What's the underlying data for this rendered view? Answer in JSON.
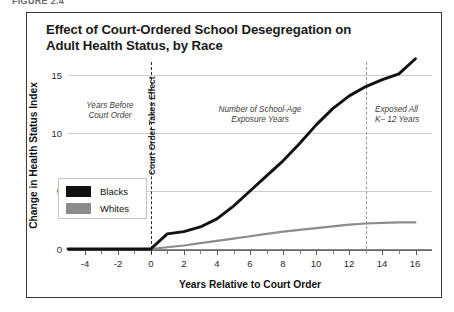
{
  "figure_label": "FIGURE 2.4",
  "title": {
    "line1": "Effect of Court-Ordered School Desegregation on",
    "line2": "Adult Health Status, by Race"
  },
  "axes": {
    "ylabel": "Change in Health Status Index",
    "xlabel": "Years Relative to Court Order",
    "yticks": [
      "0",
      "5",
      "10",
      "15"
    ],
    "xticks": [
      "-4",
      "-2",
      "0",
      "2",
      "4",
      "6",
      "8",
      "10",
      "12",
      "14",
      "16"
    ]
  },
  "legend": {
    "items": [
      {
        "label": "Blacks",
        "color": "#111111"
      },
      {
        "label": "Whites",
        "color": "#8c8c8c"
      }
    ]
  },
  "annotations": {
    "before": {
      "line1": "Years Before",
      "line2": "Court Order"
    },
    "court_order": "Court Order Takes Effect",
    "exposure": {
      "line1": "Number of School-Age",
      "line2": "Exposure Years"
    },
    "exposed_all": {
      "line1": "Exposed All",
      "line2": "K– 12 Years"
    }
  },
  "chart_data": {
    "type": "line",
    "title": "Effect of Court-Ordered School Desegregation on Adult Health Status, by Race",
    "xlabel": "Years Relative to Court Order",
    "ylabel": "Change in Health Status Index",
    "xlim": [
      -5,
      17
    ],
    "ylim": [
      -1.5,
      17.5
    ],
    "yticks": [
      0,
      5,
      10,
      15
    ],
    "xticks": [
      -4,
      -2,
      0,
      2,
      4,
      6,
      8,
      10,
      12,
      14,
      16
    ],
    "grid": "horizontal",
    "legend_position": "inside-left",
    "reference_lines": [
      {
        "x": 0,
        "label": "Court Order Takes Effect",
        "style": "dashed",
        "color": "#2b2b2b"
      },
      {
        "x": 13,
        "label": "Exposed All K-12 Years",
        "style": "dashed",
        "color": "#9a9a9a"
      }
    ],
    "x": [
      -5,
      -4,
      -3,
      -2,
      -1,
      0,
      1,
      2,
      3,
      4,
      5,
      6,
      7,
      8,
      9,
      10,
      11,
      12,
      13,
      14,
      15,
      16
    ],
    "series": [
      {
        "name": "Blacks",
        "color": "#111111",
        "values": [
          0.0,
          0.0,
          0.0,
          0.0,
          0.0,
          0.0,
          1.3,
          1.5,
          1.9,
          2.6,
          3.7,
          5.0,
          6.3,
          7.6,
          9.1,
          10.7,
          12.1,
          13.2,
          14.0,
          14.6,
          15.1,
          16.4
        ]
      },
      {
        "name": "Whites",
        "color": "#8c8c8c",
        "values": [
          0.0,
          0.0,
          0.0,
          0.0,
          0.0,
          0.0,
          0.15,
          0.3,
          0.5,
          0.7,
          0.9,
          1.1,
          1.3,
          1.5,
          1.65,
          1.8,
          1.95,
          2.1,
          2.2,
          2.25,
          2.3,
          2.3
        ]
      }
    ]
  }
}
